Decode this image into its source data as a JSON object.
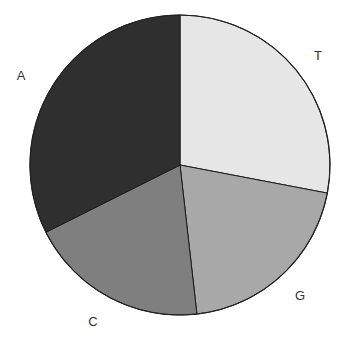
{
  "chart_data": {
    "type": "pie",
    "title": "",
    "start_angle_deg": 0,
    "direction": "clockwise",
    "categories": [
      "T",
      "G",
      "C",
      "A"
    ],
    "values": [
      28.0,
      20.2,
      19.4,
      32.4
    ],
    "units": "percent (estimated from slice angles)",
    "colors": [
      "#e6e6e6",
      "#a8a8a8",
      "#7f7f7f",
      "#2f2f2f"
    ],
    "labels": [
      {
        "text": "T",
        "x": 318,
        "y": 60
      },
      {
        "text": "G",
        "x": 300,
        "y": 300
      },
      {
        "text": "C",
        "x": 93,
        "y": 326
      },
      {
        "text": "A",
        "x": 21,
        "y": 80
      }
    ],
    "legend": "none",
    "center": [
      180,
      165
    ],
    "radius": 150
  }
}
